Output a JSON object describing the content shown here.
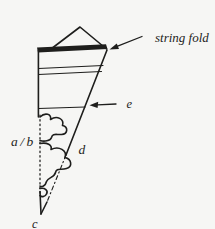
{
  "figure": {
    "type": "line-diagram",
    "background_color": "#f6f6f4",
    "ink_color": "#1e1e1c",
    "labels": {
      "string_fold": "string fold",
      "e": "e",
      "a_b": "a/b",
      "d": "d",
      "c": "c"
    }
  }
}
